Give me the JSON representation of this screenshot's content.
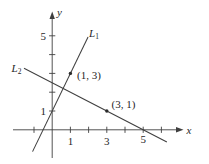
{
  "page": {
    "background": "#ffffff"
  },
  "chart_data": {
    "type": "line",
    "title": "",
    "xlabel": "x",
    "ylabel": "y",
    "xlim": [
      -2.1,
      7.2
    ],
    "ylim": [
      -1.8,
      6.3
    ],
    "grid": false,
    "axis_color": "#3f3f3f",
    "line_color": "#3f3f3f",
    "text_color": "#1f1f1f",
    "x_ticks": [
      {
        "value": -1,
        "label": ""
      },
      {
        "value": 1,
        "label": "1"
      },
      {
        "value": 2,
        "label": ""
      },
      {
        "value": 3,
        "label": "3"
      },
      {
        "value": 4,
        "label": ""
      },
      {
        "value": 5,
        "label": "5"
      },
      {
        "value": 6,
        "label": ""
      }
    ],
    "y_ticks": [
      {
        "value": 1,
        "label": "1"
      },
      {
        "value": 2,
        "label": ""
      },
      {
        "value": 3,
        "label": ""
      },
      {
        "value": 4,
        "label": ""
      },
      {
        "value": 5,
        "label": "5"
      }
    ],
    "series": [
      {
        "name": "L1",
        "label_base": "L",
        "label_sub": "1",
        "slope": 2,
        "y_intercept": 1,
        "x_intercept": -0.5,
        "points_x": [
          -1.08,
          1.97
        ],
        "points_y": [
          -1.16,
          4.94
        ]
      },
      {
        "name": "L2",
        "label_base": "L",
        "label_sub": "2",
        "slope": -0.5,
        "y_intercept": 2.5,
        "x_intercept": 5,
        "points_x": [
          -1.55,
          6.3
        ],
        "points_y": [
          3.275,
          -0.65
        ]
      }
    ],
    "marked_points": [
      {
        "x": 1,
        "y": 3,
        "label": "(1, 3)"
      },
      {
        "x": 3,
        "y": 1,
        "label": "(3, 1)"
      }
    ]
  }
}
